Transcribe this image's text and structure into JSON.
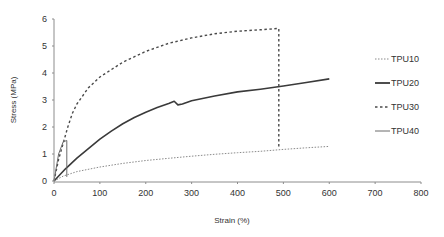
{
  "chart_data": {
    "type": "line",
    "title": "",
    "xlabel": "Strain (%)",
    "ylabel": "Stress (MPa)",
    "xlim": [
      0,
      800
    ],
    "ylim": [
      0,
      6
    ],
    "xticks": [
      0,
      100,
      200,
      300,
      400,
      500,
      600,
      700,
      800
    ],
    "yticks": [
      0,
      1,
      2,
      3,
      4,
      5,
      6
    ],
    "grid": false,
    "legend_position": "right",
    "series": [
      {
        "name": "TPU10",
        "style": "dotted",
        "color": "#8a8a8a",
        "width": 1,
        "x": [
          0,
          20,
          50,
          100,
          150,
          200,
          250,
          300,
          350,
          400,
          450,
          500,
          550,
          600
        ],
        "y": [
          0,
          0.18,
          0.35,
          0.52,
          0.65,
          0.76,
          0.84,
          0.92,
          0.99,
          1.05,
          1.1,
          1.17,
          1.23,
          1.28
        ]
      },
      {
        "name": "TPU20",
        "style": "solid",
        "color": "#3a3a3a",
        "width": 1.6,
        "x": [
          0,
          25,
          50,
          75,
          100,
          125,
          150,
          175,
          200,
          225,
          250,
          262,
          270,
          280,
          300,
          350,
          400,
          450,
          500,
          550,
          600
        ],
        "y": [
          0,
          0.45,
          0.85,
          1.2,
          1.55,
          1.85,
          2.12,
          2.35,
          2.55,
          2.72,
          2.87,
          2.95,
          2.82,
          2.85,
          2.97,
          3.15,
          3.3,
          3.4,
          3.52,
          3.65,
          3.78
        ]
      },
      {
        "name": "TPU30",
        "style": "dashed",
        "color": "#4a4a4a",
        "width": 1.4,
        "x": [
          0,
          10,
          20,
          30,
          40,
          50,
          75,
          100,
          150,
          200,
          250,
          300,
          350,
          400,
          450,
          490,
          490
        ],
        "y": [
          0,
          0.8,
          1.4,
          2.0,
          2.5,
          2.85,
          3.45,
          3.85,
          4.4,
          4.8,
          5.1,
          5.3,
          5.45,
          5.55,
          5.6,
          5.65,
          1.2
        ]
      },
      {
        "name": "TPU40",
        "style": "solid",
        "color": "#6a6a6a",
        "width": 1,
        "x": [
          0,
          10,
          20,
          28,
          28
        ],
        "y": [
          0,
          1.0,
          1.45,
          1.5,
          0.15
        ]
      }
    ]
  },
  "legend": {
    "items": [
      {
        "label": "TPU10"
      },
      {
        "label": "TPU20"
      },
      {
        "label": "TPU30"
      },
      {
        "label": "TPU40"
      }
    ]
  },
  "axes": {
    "x_title": "Strain (%)",
    "y_title": "Stress (MPa)",
    "x_tick_labels": [
      "0",
      "100",
      "200",
      "300",
      "400",
      "500",
      "600",
      "700",
      "800"
    ],
    "y_tick_labels": [
      "0",
      "1",
      "2",
      "3",
      "4",
      "5",
      "6"
    ]
  }
}
